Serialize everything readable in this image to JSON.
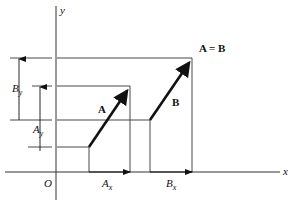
{
  "diagram": {
    "labels": {
      "y_axis": "y",
      "x_axis": "x",
      "origin": "O",
      "vector_a": "A",
      "vector_b": "B",
      "equality": "A = B",
      "ax_main": "A",
      "ax_sub": "x",
      "bx_main": "B",
      "bx_sub": "x",
      "ay_main": "A",
      "ay_sub": "y",
      "by_main": "B",
      "by_sub": "y"
    },
    "colors": {
      "line": "#333333",
      "vector": "#111111",
      "background": "#ffffff"
    }
  }
}
